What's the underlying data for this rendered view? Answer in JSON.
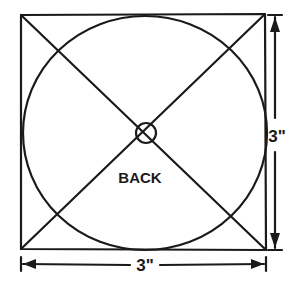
{
  "diagram": {
    "label_center": "BACK",
    "dimension_width": "3\"",
    "dimension_height": "3\"",
    "elements": [
      "square-outline",
      "diagonal-lines",
      "inscribed-circle",
      "center-marker"
    ]
  }
}
